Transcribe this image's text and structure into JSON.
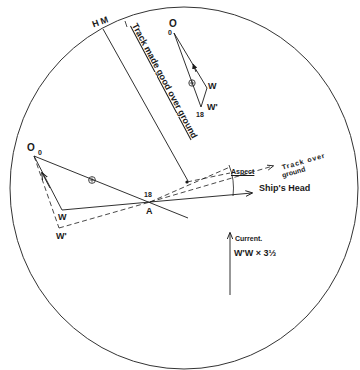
{
  "diagram": {
    "type": "radar-plot",
    "colors": {
      "ink": "#1a1a1a",
      "background": "#ffffff"
    },
    "labels": {
      "heading_marker": "H M",
      "track_made_good": "Track made good over ground",
      "top_plot": {
        "origin": "O",
        "origin_time": "0",
        "w": "W",
        "w_prime": "W'",
        "time_end": "18"
      },
      "main_plot": {
        "origin": "O",
        "origin_time": "0",
        "w": "W",
        "w_prime": "W'",
        "time_end": "18",
        "point_a": "A"
      },
      "aspect": "Aspect",
      "track_over_ground_1": "Track over",
      "track_over_ground_2": "ground",
      "ships_head": "Ship's Head",
      "current": "Current.",
      "current_formula": "W'W × 3⅓"
    }
  }
}
